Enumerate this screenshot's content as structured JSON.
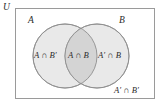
{
  "figure": {
    "type": "venn-diagram",
    "sets": 2,
    "background_color": "#ffffff",
    "border_color": "#9a9a9a",
    "circle_fill_color": "#e9e9e9",
    "circle_stroke_color": "#8e8e8e",
    "intersection_fill_color": "#d4d4d4",
    "text_color": "#2b2b2b"
  },
  "universe": {
    "label": "U"
  },
  "sets": [
    {
      "id": "a",
      "label": "A"
    },
    {
      "id": "b",
      "label": "B"
    }
  ],
  "regions": [
    {
      "id": "a-only",
      "label": "A ∩ B′"
    },
    {
      "id": "both",
      "label": "A ∩ B"
    },
    {
      "id": "b-only",
      "label": "A′ ∩ B"
    },
    {
      "id": "neither",
      "label": "A′ ∩ B′"
    }
  ],
  "geometry": {
    "rect": {
      "x": 15,
      "y": 8,
      "width": 140,
      "height": 91
    },
    "circle_a": {
      "cx": 65,
      "cy": 56,
      "r": 32
    },
    "circle_b": {
      "cx": 97,
      "cy": 56,
      "r": 32
    }
  }
}
